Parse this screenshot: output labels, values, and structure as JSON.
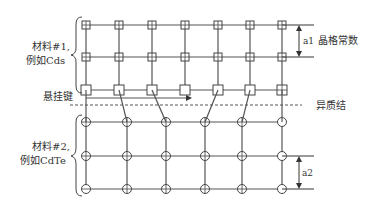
{
  "labels": {
    "material1_line1": "材料#1,",
    "material1_line2": "例如Cds",
    "material2_line1": "材料#2,",
    "material2_line2": "例如CdTe",
    "dangling_bond": "悬挂键",
    "heterojunction": "异质结",
    "lattice_constant": "晶格常数",
    "a1": "a1",
    "a2": "a2"
  },
  "lattice": {
    "top_material": {
      "columns": 7,
      "rows": 3,
      "node_shape": "square"
    },
    "bottom_material": {
      "columns": 6,
      "rows": 3,
      "node_shape": "circle"
    }
  }
}
